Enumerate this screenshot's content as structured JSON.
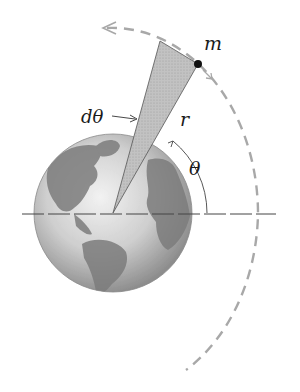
{
  "diagram": {
    "labels": {
      "mass": "m",
      "radius": "r",
      "angle": "θ",
      "dangle": "dθ"
    },
    "colors": {
      "orbit": "#a8a8a8",
      "wedge": "#bdbdbd",
      "wedge_stroke": "#555555",
      "axis": "#444444",
      "mass": "#111111",
      "ocean_light": "#e4e4e4",
      "ocean_dark": "#9a9a9a",
      "land": "#7a7a7a"
    },
    "geometry": {
      "earth_center": [
        113,
        213
      ],
      "earth_radius": 79,
      "orbit_direction": "counterclockwise"
    }
  }
}
